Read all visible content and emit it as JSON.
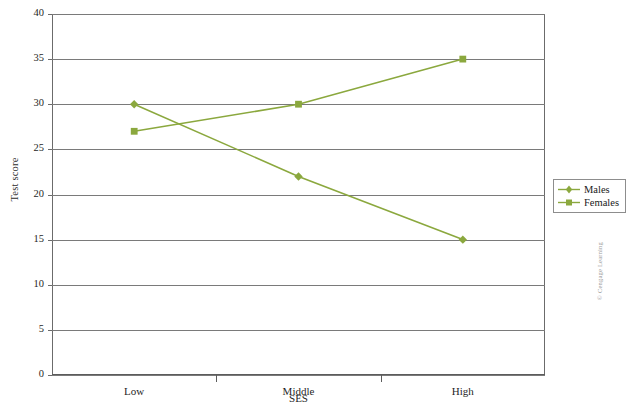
{
  "chart_data": {
    "type": "line",
    "title": "",
    "xlabel": "SES",
    "ylabel": "Test score",
    "categories": [
      "Low",
      "Middle",
      "High"
    ],
    "series": [
      {
        "name": "Males",
        "values": [
          30,
          22,
          15
        ],
        "marker": "diamond",
        "color": "#8ba83e"
      },
      {
        "name": "Females",
        "values": [
          27,
          30,
          35
        ],
        "marker": "square",
        "color": "#8ba83e"
      }
    ],
    "ylim": [
      0,
      40
    ],
    "ytick_values": [
      0,
      5,
      10,
      15,
      20,
      25,
      30,
      35,
      40
    ],
    "ytick_labels": [
      "0",
      "5",
      "10",
      "15",
      "20",
      "25",
      "30",
      "35",
      "40"
    ],
    "grid": "horizontal",
    "legend_position": "right",
    "line_color": "#8ba83e",
    "grid_color": "#7a7a7a",
    "axis_color": "#5c5c5c"
  },
  "legend": {
    "entries": [
      {
        "label": "Males"
      },
      {
        "label": "Females"
      }
    ]
  },
  "credit": {
    "text": "© Cengage Learning"
  }
}
